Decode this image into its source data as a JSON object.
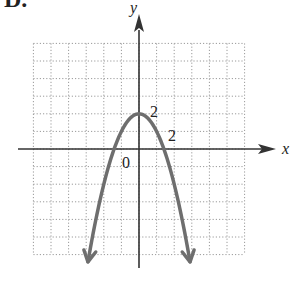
{
  "problem_label": "D.",
  "chart_data": {
    "type": "line",
    "title": "",
    "function": "y = 2 - x^2",
    "xlabel": "x",
    "ylabel": "y",
    "xlim": [
      -6,
      6
    ],
    "ylim": [
      -6,
      6
    ],
    "grid": true,
    "grid_style": "dotted",
    "grid_step": 1,
    "annotations": [
      {
        "text": "2",
        "near": [
          0,
          2
        ],
        "meaning": "y-intercept / vertex label"
      },
      {
        "text": "2",
        "near": [
          2,
          0
        ],
        "meaning": "x tick label"
      },
      {
        "text": "0",
        "near": [
          0,
          0
        ],
        "meaning": "origin label"
      }
    ],
    "series": [
      {
        "name": "parabola",
        "color": "#6e6e6e",
        "domain": [
          -2.9,
          2.9
        ],
        "arrows": "both-ends-down",
        "x": [
          -2.9,
          -2.5,
          -2,
          -1.5,
          -1.414,
          -1,
          -0.5,
          0,
          0.5,
          1,
          1.414,
          1.5,
          2,
          2.5,
          2.9
        ],
        "y": [
          -6.41,
          -4.25,
          -2,
          -0.25,
          0,
          1,
          1.75,
          2,
          1.75,
          1,
          0,
          -0.25,
          -2,
          -4.25,
          -6.41
        ]
      }
    ],
    "vertex": [
      0,
      2
    ],
    "x_intercepts": [
      -1.414,
      1.414
    ]
  },
  "labels": {
    "x_axis": "x",
    "y_axis": "y",
    "origin": "0",
    "y_tick": "2",
    "x_tick": "2"
  },
  "colors": {
    "axis": "#333333",
    "grid": "#9a9a9a",
    "curve": "#6e6e6e"
  }
}
